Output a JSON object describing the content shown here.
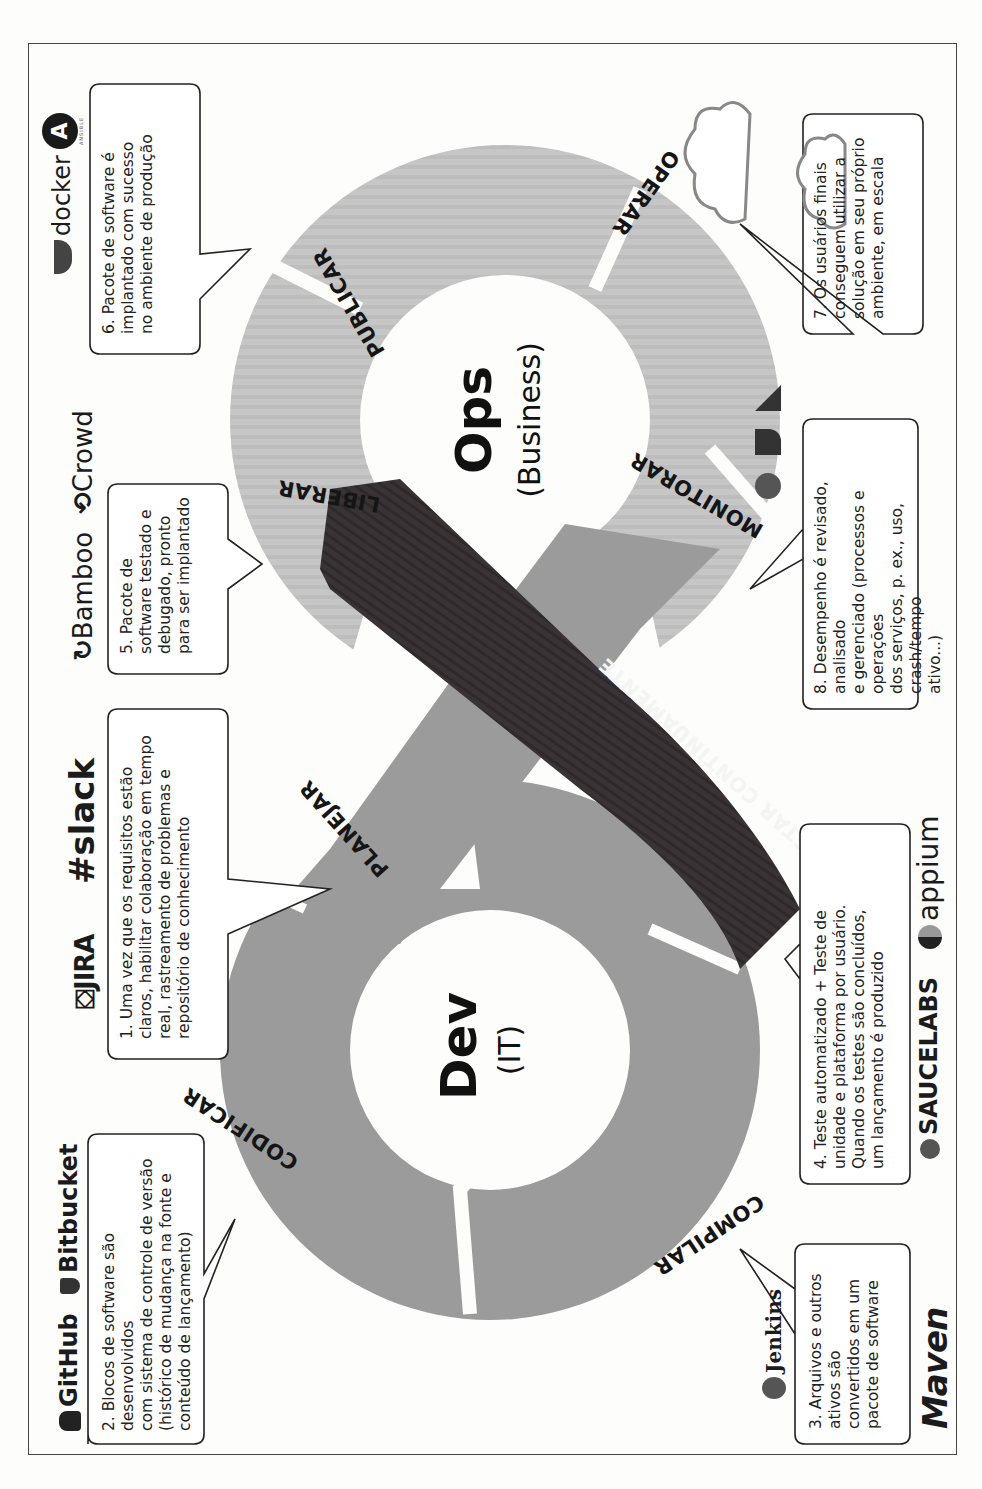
{
  "diagram": {
    "type": "devops-infinity-loop",
    "orientation": "rotated-90-ccw",
    "colors": {
      "dev_loop": "#9b9b9b",
      "ops_loop": "#c6c6c6",
      "test_band": "#3a3336",
      "background": "#fdfdfb",
      "text": "#151515"
    },
    "dev": {
      "title": "Dev",
      "subtitle": "(IT)"
    },
    "ops": {
      "title": "Ops",
      "subtitle": "(Business)"
    },
    "stages": [
      {
        "id": "planejar",
        "label": "PLANEJAR",
        "loop": "dev"
      },
      {
        "id": "codificar",
        "label": "CODIFICAR",
        "loop": "dev"
      },
      {
        "id": "compilar",
        "label": "COMPILAR",
        "loop": "dev"
      },
      {
        "id": "testar",
        "label": "TESTAR CONTINUAMENTE",
        "loop": "cross"
      },
      {
        "id": "liberar",
        "label": "LIBERAR",
        "loop": "ops"
      },
      {
        "id": "publicar",
        "label": "PUBLICAR",
        "loop": "ops"
      },
      {
        "id": "operar",
        "label": "OPERAR",
        "loop": "ops"
      },
      {
        "id": "monitorar",
        "label": "MONITORAR",
        "loop": "ops"
      }
    ],
    "callouts": [
      {
        "n": "1",
        "text_parts": [
          "1. Uma vez que os requisitos estão claros, habilitar colaboração em tempo real, rastreamento de problemas e repositório de conhecimento"
        ],
        "lines": [
          "1. Uma vez que os requisitos estão",
          "claros, habilitar colaboração em tempo",
          "real, rastreamento de problemas e",
          "repositório de conhecimento"
        ],
        "tools": [
          "JIRA",
          "slack"
        ]
      },
      {
        "n": "2",
        "lines": [
          "2. Blocos de software são desenvolvidos",
          "com sistema de controle de versão",
          "(histórico de mudança na fonte e",
          "conteúdo de lançamento)"
        ],
        "tools": [
          "GitHub",
          "Bitbucket"
        ]
      },
      {
        "n": "3",
        "lines": [
          "3. Arquivos e outros",
          "ativos são",
          "convertidos em um",
          "pacote de software"
        ],
        "tools": [
          "Jenkins",
          "Maven"
        ]
      },
      {
        "n": "4",
        "lines": [
          "4. Teste automatizado + Teste de",
          "unidade e plataforma por usuário.",
          "Quando os testes são concluídos,",
          "um lançamento é produzido"
        ],
        "tools": [
          "SAUCELABS",
          "appium"
        ]
      },
      {
        "n": "5",
        "lines": [
          "5. Pacote de",
          "software testado e",
          "debugado, pronto",
          "para ser implantado"
        ],
        "tools": [
          "Bamboo",
          "Crowd"
        ]
      },
      {
        "n": "6",
        "lines": [
          "6. Pacote de software é",
          "implantado com sucesso",
          "no ambiente de produção"
        ],
        "tools": [
          "docker",
          "ANSIBLE"
        ]
      },
      {
        "n": "7",
        "lines": [
          "7. Os usuários finais",
          "conseguem utilizar a",
          "solução em seu próprio",
          "ambiente, em escala"
        ],
        "tools": [
          "cloud-diagram"
        ]
      },
      {
        "n": "8",
        "lines": [
          "8. Desempenho é revisado, analisado",
          "e gerenciado (processos e operações",
          "dos serviços, p. ex., uso, crash/tempo",
          "ativo...)"
        ],
        "tools": [
          "ELK-stack"
        ]
      }
    ],
    "logos": {
      "github": "GitHub",
      "bitbucket": "Bitbucket",
      "jira": "JIRA",
      "slack": "slack",
      "bamboo": "Bamboo",
      "crowd": "Crowd",
      "docker": "docker",
      "ansible": "ANSIBLE",
      "jenkins": "Jenkins",
      "maven": "Maven",
      "saucelabs": "SAUCELABS",
      "appium": "appium"
    }
  }
}
